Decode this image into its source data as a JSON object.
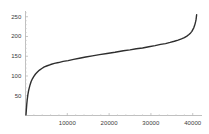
{
  "chart_data": {
    "type": "line",
    "title": "",
    "subtitle": "",
    "xlabel": "",
    "ylabel": "",
    "xlim": [
      0,
      41500
    ],
    "ylim": [
      0,
      262
    ],
    "grid": false,
    "legend": null,
    "axis_color": "#b0b0b0",
    "line_color": "#2e2e2e",
    "line_width": 1.4,
    "x_ticks": [
      10000,
      20000,
      30000,
      40000
    ],
    "x_tick_labels": [
      "10000",
      "20000",
      "30000",
      "40000"
    ],
    "y_ticks": [
      50,
      100,
      150,
      200,
      250
    ],
    "y_tick_labels": [
      "50",
      "100",
      "150",
      "200",
      "250"
    ],
    "series": [
      {
        "name": "curve",
        "x": [
          120,
          200,
          300,
          420,
          560,
          720,
          900,
          1100,
          1350,
          1650,
          2000,
          2400,
          2850,
          3350,
          3900,
          4500,
          5200,
          6000,
          6900,
          7900,
          9000,
          10200,
          11500,
          12900,
          14400,
          16000,
          17700,
          19500,
          21400,
          23400,
          25000,
          26500,
          28000,
          29500,
          31000,
          32300,
          33500,
          34600,
          35600,
          36500,
          37300,
          38000,
          38600,
          39100,
          39500,
          39800,
          40050,
          40250,
          40420,
          40560,
          40680,
          40780,
          40860,
          40930
        ],
        "y": [
          2,
          14,
          28,
          41,
          52,
          62,
          70,
          78,
          86,
          93,
          99,
          105,
          110,
          115,
          119,
          123,
          126,
          129,
          132,
          134,
          137,
          139,
          142,
          145,
          148,
          151,
          154,
          157,
          160,
          164,
          166,
          169,
          171,
          174,
          177,
          180,
          182,
          185,
          188,
          191,
          194,
          197,
          201,
          205,
          209,
          213,
          218,
          222,
          227,
          232,
          237,
          242,
          248,
          255
        ]
      }
    ]
  },
  "axes": {
    "y_axis_name": "value-axis",
    "x_axis_name": "index-axis"
  }
}
